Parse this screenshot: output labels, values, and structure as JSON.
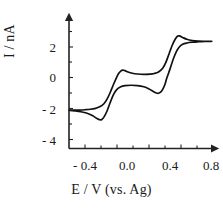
{
  "chart_data": {
    "type": "line",
    "title": "",
    "subtitle": "",
    "xlabel": "E / V (vs. Ag)",
    "ylabel": "I / nA",
    "xlim": [
      -0.55,
      0.85
    ],
    "ylim": [
      -4.6,
      3.2
    ],
    "xticks": [
      -0.4,
      0.0,
      0.4,
      0.8
    ],
    "xticklabels": [
      "- 0.4",
      "0.0",
      "0.4",
      "0.8"
    ],
    "yticks": [
      2,
      0,
      -2,
      -4
    ],
    "yticklabels": [
      "2",
      "0",
      "- 2",
      "- 4"
    ],
    "x_minor_tick_step": 0.1,
    "y_minor_tick_step": 1,
    "grid": false,
    "legend": false,
    "legend_position": "none",
    "axes_style": "two-spine-arrow",
    "series": [
      {
        "name": "cyclic voltammogram",
        "color": "#111111",
        "description": "Two reversible redox waves, forward (anodic) sweep from -0.55 V to 0.8 V then reverse (cathodic) sweep back",
        "forward_sweep": [
          [
            -0.55,
            -2.1
          ],
          [
            -0.5,
            -2.1
          ],
          [
            -0.45,
            -2.09
          ],
          [
            -0.4,
            -2.07
          ],
          [
            -0.35,
            -2.04
          ],
          [
            -0.3,
            -1.98
          ],
          [
            -0.26,
            -1.88
          ],
          [
            -0.22,
            -1.68
          ],
          [
            -0.19,
            -1.38
          ],
          [
            -0.16,
            -0.95
          ],
          [
            -0.13,
            -0.45
          ],
          [
            -0.1,
            0.02
          ],
          [
            -0.08,
            0.28
          ],
          [
            -0.06,
            0.44
          ],
          [
            -0.04,
            0.5
          ],
          [
            -0.02,
            0.47
          ],
          [
            0.01,
            0.38
          ],
          [
            0.05,
            0.3
          ],
          [
            0.1,
            0.25
          ],
          [
            0.16,
            0.23
          ],
          [
            0.22,
            0.24
          ],
          [
            0.26,
            0.28
          ],
          [
            0.3,
            0.38
          ],
          [
            0.34,
            0.62
          ],
          [
            0.37,
            1.0
          ],
          [
            0.4,
            1.55
          ],
          [
            0.43,
            2.1
          ],
          [
            0.46,
            2.52
          ],
          [
            0.48,
            2.7
          ],
          [
            0.5,
            2.72
          ],
          [
            0.53,
            2.62
          ],
          [
            0.57,
            2.5
          ],
          [
            0.62,
            2.42
          ],
          [
            0.68,
            2.38
          ],
          [
            0.74,
            2.37
          ],
          [
            0.8,
            2.37
          ]
        ],
        "reverse_sweep": [
          [
            0.8,
            2.37
          ],
          [
            0.74,
            2.36
          ],
          [
            0.68,
            2.34
          ],
          [
            0.62,
            2.31
          ],
          [
            0.57,
            2.26
          ],
          [
            0.53,
            2.18
          ],
          [
            0.5,
            2.02
          ],
          [
            0.47,
            1.7
          ],
          [
            0.44,
            1.2
          ],
          [
            0.41,
            0.58
          ],
          [
            0.38,
            0.0
          ],
          [
            0.36,
            -0.45
          ],
          [
            0.34,
            -0.75
          ],
          [
            0.32,
            -0.93
          ],
          [
            0.3,
            -1.0
          ],
          [
            0.28,
            -0.98
          ],
          [
            0.25,
            -0.88
          ],
          [
            0.21,
            -0.72
          ],
          [
            0.16,
            -0.58
          ],
          [
            0.1,
            -0.5
          ],
          [
            0.04,
            -0.48
          ],
          [
            -0.02,
            -0.5
          ],
          [
            -0.06,
            -0.58
          ],
          [
            -0.1,
            -0.78
          ],
          [
            -0.13,
            -1.1
          ],
          [
            -0.16,
            -1.6
          ],
          [
            -0.19,
            -2.15
          ],
          [
            -0.22,
            -2.55
          ],
          [
            -0.24,
            -2.7
          ],
          [
            -0.26,
            -2.72
          ],
          [
            -0.29,
            -2.62
          ],
          [
            -0.33,
            -2.45
          ],
          [
            -0.38,
            -2.3
          ],
          [
            -0.44,
            -2.2
          ],
          [
            -0.5,
            -2.14
          ],
          [
            -0.55,
            -2.1
          ]
        ],
        "features": {
          "wave1_anodic_peak": {
            "E": -0.04,
            "I": 0.5
          },
          "wave1_cathodic_peak": {
            "E": -0.25,
            "I": -2.72
          },
          "wave2_anodic_peak": {
            "E": 0.49,
            "I": 2.72
          },
          "wave2_cathodic_peak": {
            "E": 0.3,
            "I": -1.0
          }
        }
      }
    ]
  },
  "axes": {
    "xlabel": "E / V (vs. Ag)",
    "ylabel": "I / nA",
    "xticklabels": [
      "- 0.4",
      "0.0",
      "0.4",
      "0.8"
    ],
    "yticklabels": [
      "2",
      "0",
      "- 2",
      "- 4"
    ]
  }
}
